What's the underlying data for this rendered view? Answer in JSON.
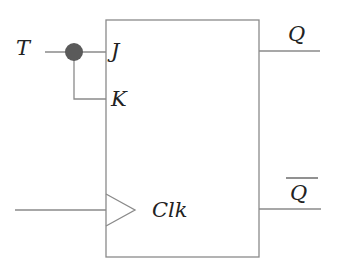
{
  "diagram": {
    "type": "T flip-flop built from JK flip-flop",
    "colors": {
      "wire": "#8a8a8a",
      "text": "#222222",
      "junction": "#5a5a5a",
      "background": "#ffffff"
    },
    "inputs": {
      "t": "T",
      "clock_line": ""
    },
    "block": {
      "pins_left": {
        "j": "J",
        "k": "K",
        "clk": "Clk"
      },
      "pins_right": {
        "q": "Q",
        "q_bar": "Q"
      }
    },
    "junction": {
      "shape": "filled-circle"
    }
  }
}
